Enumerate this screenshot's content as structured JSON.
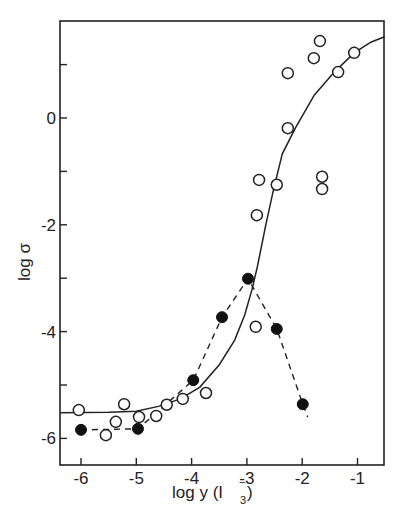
{
  "chart_data": {
    "type": "scatter",
    "title": "",
    "xlabel": "log y (I3-)",
    "ylabel": "log σ",
    "xlim": [
      -6.4,
      -0.5
    ],
    "ylim": [
      -6.6,
      1.8
    ],
    "x_ticks": [
      -6,
      -5,
      -4,
      -3,
      -2,
      -1
    ],
    "x_tick_labels": [
      "-6",
      "-5",
      "-4",
      "-3",
      "-2",
      "-1"
    ],
    "y_ticks": [
      1,
      0,
      -1,
      -2,
      -3,
      -4,
      -5,
      -6
    ],
    "y_tick_labels": [
      "",
      "0",
      "",
      "-2",
      "",
      "-4",
      "",
      "-6"
    ],
    "grid": false,
    "legend": null,
    "series": [
      {
        "name": "open circles",
        "marker": "open-circle",
        "line": "none",
        "points": [
          {
            "x": -6.04,
            "y": -5.47
          },
          {
            "x": -5.55,
            "y": -5.94
          },
          {
            "x": -5.37,
            "y": -5.69
          },
          {
            "x": -5.22,
            "y": -5.36
          },
          {
            "x": -4.95,
            "y": -5.6
          },
          {
            "x": -4.64,
            "y": -5.58
          },
          {
            "x": -4.45,
            "y": -5.37
          },
          {
            "x": -4.16,
            "y": -5.26
          },
          {
            "x": -3.74,
            "y": -5.15
          },
          {
            "x": -2.84,
            "y": -3.91
          },
          {
            "x": -2.82,
            "y": -1.82
          },
          {
            "x": -2.78,
            "y": -1.16
          },
          {
            "x": -2.46,
            "y": -1.25
          },
          {
            "x": -2.26,
            "y": -0.19
          },
          {
            "x": -2.26,
            "y": 0.84
          },
          {
            "x": -1.79,
            "y": 1.12
          },
          {
            "x": -1.68,
            "y": 1.44
          },
          {
            "x": -1.64,
            "y": -1.1
          },
          {
            "x": -1.64,
            "y": -1.33
          },
          {
            "x": -1.35,
            "y": 0.86
          },
          {
            "x": -1.06,
            "y": 1.22
          }
        ]
      },
      {
        "name": "filled circles",
        "marker": "filled-circle",
        "line": "dashed",
        "points": [
          {
            "x": -6.0,
            "y": -5.84
          },
          {
            "x": -4.97,
            "y": -5.82
          },
          {
            "x": -3.97,
            "y": -4.91
          },
          {
            "x": -3.45,
            "y": -3.73
          },
          {
            "x": -2.98,
            "y": -3.01
          },
          {
            "x": -2.46,
            "y": -3.95
          },
          {
            "x": -1.99,
            "y": -5.36
          }
        ],
        "line_end": {
          "x": -1.9,
          "y": -5.6
        }
      },
      {
        "name": "fitted curve",
        "marker": "none",
        "line": "solid",
        "points": [
          {
            "x": -6.38,
            "y": -5.52
          },
          {
            "x": -5.5,
            "y": -5.51
          },
          {
            "x": -5.0,
            "y": -5.49
          },
          {
            "x": -4.6,
            "y": -5.4
          },
          {
            "x": -4.2,
            "y": -5.26
          },
          {
            "x": -3.85,
            "y": -5.04
          },
          {
            "x": -3.5,
            "y": -4.62
          },
          {
            "x": -3.22,
            "y": -4.16
          },
          {
            "x": -3.04,
            "y": -3.69
          },
          {
            "x": -2.91,
            "y": -3.22
          },
          {
            "x": -2.81,
            "y": -2.78
          },
          {
            "x": -2.66,
            "y": -2.01
          },
          {
            "x": -2.52,
            "y": -1.35
          },
          {
            "x": -2.36,
            "y": -0.67
          },
          {
            "x": -2.12,
            "y": -0.18
          },
          {
            "x": -1.78,
            "y": 0.43
          },
          {
            "x": -1.42,
            "y": 0.86
          },
          {
            "x": -1.06,
            "y": 1.22
          },
          {
            "x": -0.76,
            "y": 1.42
          },
          {
            "x": -0.51,
            "y": 1.52
          }
        ]
      }
    ]
  },
  "axes": {
    "xlabel_main": "log y (I",
    "xlabel_sub": "3",
    "xlabel_sup": "−",
    "xlabel_close": ")",
    "ylabel": "log σ"
  }
}
